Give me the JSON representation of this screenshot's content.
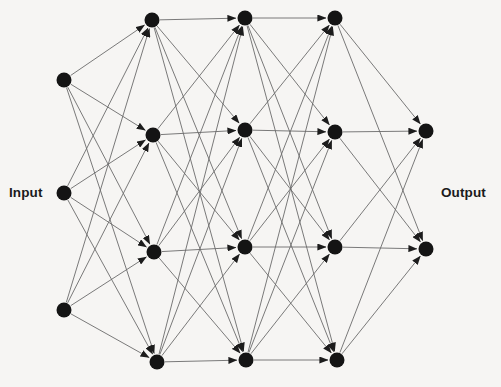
{
  "diagram": {
    "type": "feedforward-neural-network",
    "title": "",
    "background_color": "#f6f5f3",
    "node_color": "#141414",
    "edge_color": "#6b6b6b",
    "label_color": "#1b1b1b",
    "node_radius": 7.5,
    "edge_width": 0.9,
    "canvas": {
      "width": 501,
      "height": 387
    },
    "labels": {
      "input": "Input",
      "output": "Output"
    },
    "layers": [
      {
        "name": "input-layer",
        "label": "Input",
        "count": 3,
        "x": 64,
        "nodes": [
          {
            "id": "in-1",
            "x": 64,
            "y": 80
          },
          {
            "id": "in-2",
            "x": 64,
            "y": 193
          },
          {
            "id": "in-3",
            "x": 64,
            "y": 310
          }
        ]
      },
      {
        "name": "hidden-layer-1",
        "label": "",
        "count": 4,
        "x": 153,
        "nodes": [
          {
            "id": "h1-1",
            "x": 152,
            "y": 20
          },
          {
            "id": "h1-2",
            "x": 153,
            "y": 135
          },
          {
            "id": "h1-3",
            "x": 154,
            "y": 252
          },
          {
            "id": "h1-4",
            "x": 157,
            "y": 362
          }
        ]
      },
      {
        "name": "hidden-layer-2",
        "label": "",
        "count": 4,
        "x": 245,
        "nodes": [
          {
            "id": "h2-1",
            "x": 245,
            "y": 18
          },
          {
            "id": "h2-2",
            "x": 245,
            "y": 130
          },
          {
            "id": "h2-3",
            "x": 245,
            "y": 247
          },
          {
            "id": "h2-4",
            "x": 246,
            "y": 360
          }
        ]
      },
      {
        "name": "hidden-layer-3",
        "label": "",
        "count": 4,
        "x": 335,
        "nodes": [
          {
            "id": "h3-1",
            "x": 335,
            "y": 18
          },
          {
            "id": "h3-2",
            "x": 335,
            "y": 132
          },
          {
            "id": "h3-3",
            "x": 335,
            "y": 247
          },
          {
            "id": "h3-4",
            "x": 337,
            "y": 360
          }
        ]
      },
      {
        "name": "output-layer",
        "label": "Output",
        "count": 2,
        "x": 426,
        "nodes": [
          {
            "id": "out-1",
            "x": 426,
            "y": 131
          },
          {
            "id": "out-2",
            "x": 426,
            "y": 249
          }
        ]
      }
    ],
    "connections": {
      "style": "fully-connected-directed",
      "arrowheads": true,
      "direction": "left-to-right"
    }
  }
}
